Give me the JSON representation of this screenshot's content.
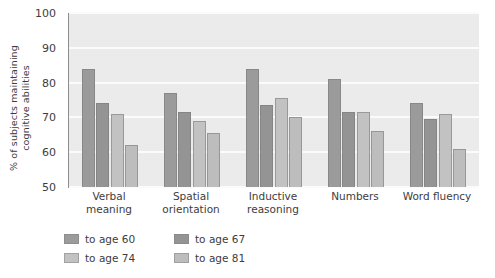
{
  "chart_data": {
    "type": "bar",
    "title": "",
    "xlabel": "",
    "ylabel": "% of subjects maintaining\ncognitive abilities",
    "ylim": [
      50,
      100
    ],
    "yticks": [
      50,
      60,
      70,
      80,
      90,
      100
    ],
    "grid": true,
    "legend_position": "below-left",
    "categories": [
      "Verbal\nmeaning",
      "Spatial\norientation",
      "Inductive\nreasoning",
      "Numbers",
      "Word fluency"
    ],
    "series": [
      {
        "name": "to age 60",
        "color": "#9b9b9b",
        "values": [
          84,
          77,
          84,
          81,
          74
        ]
      },
      {
        "name": "to age 67",
        "color": "#949494",
        "values": [
          74,
          71.5,
          73.5,
          71.5,
          69.5
        ]
      },
      {
        "name": "to age 74",
        "color": "#c2c2c2",
        "values": [
          71,
          69,
          75.5,
          71.5,
          71
        ]
      },
      {
        "name": "to age 81",
        "color": "#bdbdbd",
        "values": [
          62,
          65.5,
          70,
          66,
          61
        ]
      }
    ]
  },
  "axes": {
    "ytick_labels": [
      "100",
      "90",
      "80",
      "70",
      "60",
      "50"
    ],
    "plot_background": "#ebebeb",
    "gridline_color": "#fbfbfb",
    "axis_color": "#8d8d8d"
  },
  "legend": {
    "items": [
      {
        "label": "to age 60",
        "color": "#9b9b9b"
      },
      {
        "label": "to age 67",
        "color": "#949494"
      },
      {
        "label": "to age 74",
        "color": "#c2c2c2"
      },
      {
        "label": "to age 81",
        "color": "#bdbdbd"
      }
    ]
  }
}
